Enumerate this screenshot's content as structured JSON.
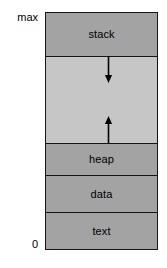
{
  "diagram": {
    "axis": {
      "top_label": "max",
      "bottom_label": "0"
    },
    "colors": {
      "segment_fill": "#a3a3a3",
      "free_space_fill": "#c6c6c6",
      "border": "#151515",
      "text": "#000000",
      "background": "#ffffff"
    },
    "segments": [
      {
        "id": "stack",
        "label": "stack",
        "fill": "filled"
      },
      {
        "id": "free",
        "label": "",
        "fill": "free"
      },
      {
        "id": "heap",
        "label": "heap",
        "fill": "filled"
      },
      {
        "id": "data",
        "label": "data",
        "fill": "filled"
      },
      {
        "id": "text",
        "label": "text",
        "fill": "filled"
      }
    ],
    "arrows": [
      {
        "id": "stack-growth",
        "direction": "down",
        "icon": "arrow-down-icon"
      },
      {
        "id": "heap-growth",
        "direction": "up",
        "icon": "arrow-up-icon"
      }
    ]
  }
}
